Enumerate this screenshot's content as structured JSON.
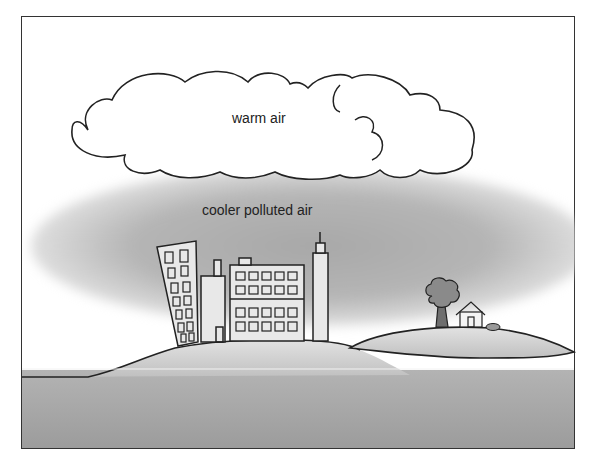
{
  "diagram": {
    "labels": {
      "upper_layer": "warm air",
      "lower_layer": "cooler polluted air"
    },
    "elements": [
      "cloud",
      "polluted-air-haze",
      "city-buildings",
      "hills",
      "tree",
      "house",
      "bush",
      "ground"
    ],
    "colors": {
      "haze": "#b0b0b0",
      "ground": "#a9a9a9",
      "hill": "#cfcfcf",
      "outline": "#222222",
      "building_fill": "#e6e6e6",
      "tree": "#7a7a7a"
    }
  }
}
